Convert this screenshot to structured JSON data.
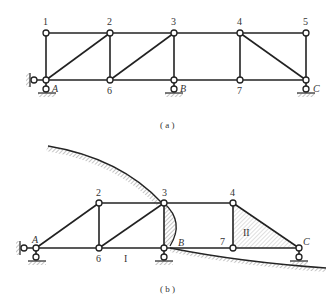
{
  "figure_a": {
    "caption": "( a )",
    "nodes": [
      {
        "id": "1",
        "label": "1",
        "x": 46,
        "y": 33
      },
      {
        "id": "2",
        "label": "2",
        "x": 110,
        "y": 33
      },
      {
        "id": "3",
        "label": "3",
        "x": 174,
        "y": 33
      },
      {
        "id": "4",
        "label": "4",
        "x": 240,
        "y": 33
      },
      {
        "id": "5",
        "label": "5",
        "x": 306,
        "y": 33
      },
      {
        "id": "A",
        "label": "A",
        "x": 46,
        "y": 80
      },
      {
        "id": "6",
        "label": "6",
        "x": 110,
        "y": 80
      },
      {
        "id": "B",
        "label": "B",
        "x": 174,
        "y": 80
      },
      {
        "id": "7",
        "label": "7",
        "x": 240,
        "y": 80
      },
      {
        "id": "C",
        "label": "C",
        "x": 306,
        "y": 80
      }
    ],
    "members": [
      [
        "1",
        "2"
      ],
      [
        "2",
        "3"
      ],
      [
        "3",
        "4"
      ],
      [
        "4",
        "5"
      ],
      [
        "A",
        "6"
      ],
      [
        "6",
        "B"
      ],
      [
        "B",
        "7"
      ],
      [
        "7",
        "C"
      ],
      [
        "1",
        "A"
      ],
      [
        "2",
        "6"
      ],
      [
        "3",
        "B"
      ],
      [
        "4",
        "7"
      ],
      [
        "5",
        "C"
      ],
      [
        "A",
        "2"
      ],
      [
        "6",
        "3"
      ],
      [
        "4",
        "C"
      ]
    ],
    "supports": [
      "A: fixed pin (horizontal + vertical)",
      "B: roller",
      "C: roller"
    ]
  },
  "figure_b": {
    "caption": "( b )",
    "nodes": [
      {
        "id": "2",
        "label": "2",
        "x": 99,
        "y": 203
      },
      {
        "id": "3",
        "label": "3",
        "x": 164,
        "y": 203
      },
      {
        "id": "4",
        "label": "4",
        "x": 233,
        "y": 203
      },
      {
        "id": "A",
        "label": "A",
        "x": 36,
        "y": 248
      },
      {
        "id": "6",
        "label": "6",
        "x": 99,
        "y": 248
      },
      {
        "id": "B",
        "label": "B",
        "x": 164,
        "y": 248
      },
      {
        "id": "7",
        "label": "7",
        "x": 233,
        "y": 248
      },
      {
        "id": "C",
        "label": "C",
        "x": 299,
        "y": 248
      }
    ],
    "members": [
      [
        "A",
        "2"
      ],
      [
        "2",
        "3"
      ],
      [
        "3",
        "4"
      ],
      [
        "A",
        "6"
      ],
      [
        "6",
        "B"
      ],
      [
        "B",
        "7"
      ],
      [
        "7",
        "C"
      ],
      [
        "2",
        "6"
      ],
      [
        "6",
        "3"
      ],
      [
        "3",
        "B"
      ],
      [
        "4",
        "7"
      ],
      [
        "4",
        "C"
      ]
    ],
    "region_labels": {
      "one": "I",
      "two": "II"
    }
  }
}
